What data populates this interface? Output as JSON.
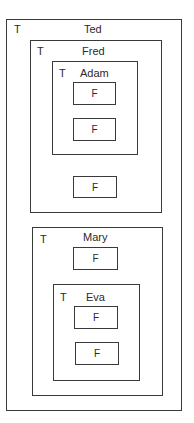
{
  "nodes": {
    "ted": {
      "type_tag": "T",
      "name": "Ted"
    },
    "fred": {
      "type_tag": "T",
      "name": "Fred"
    },
    "adam": {
      "type_tag": "T",
      "name": "Adam",
      "children": [
        "F",
        "F"
      ]
    },
    "fred_leaf": "F",
    "mary": {
      "type_tag": "T",
      "name": "Mary",
      "leaf": "F"
    },
    "eva": {
      "type_tag": "T",
      "name": "Eva",
      "children": [
        "F",
        "F"
      ]
    }
  }
}
